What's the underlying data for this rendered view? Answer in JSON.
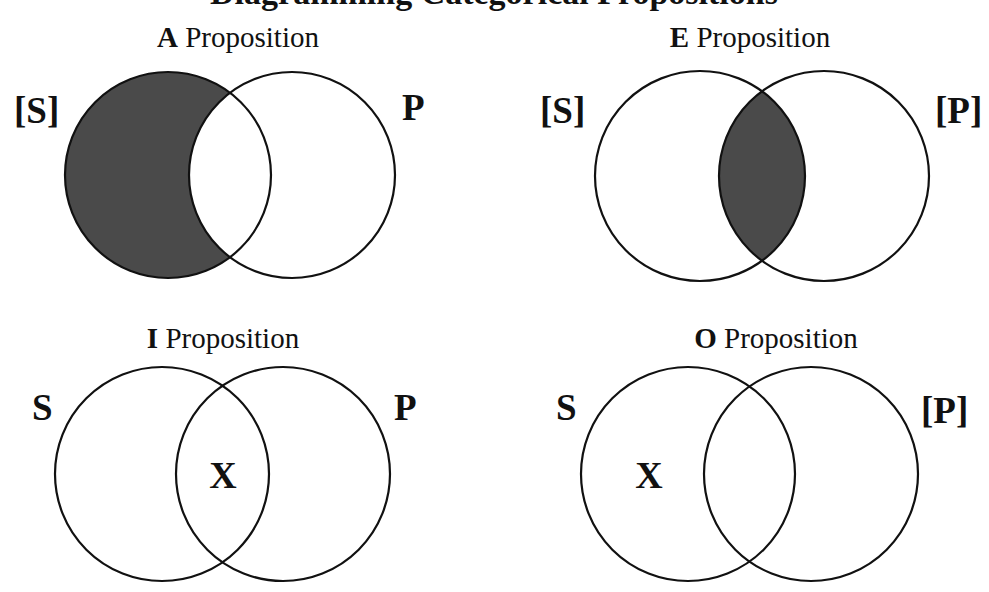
{
  "page": {
    "title_partial": "Diagramming Categorical Propositions",
    "title_visibility": "cut off at top edge; only descenders visible"
  },
  "colors": {
    "background": "#ffffff",
    "stroke": "#111111",
    "shade": "#4a4a4a",
    "text": "#111111"
  },
  "diagrams": [
    {
      "id": "A",
      "letter": "A",
      "word": "Proposition",
      "subject_label": "[S]",
      "predicate_label": "P",
      "shaded_region": "S only (S outside P)",
      "x_mark": "",
      "x_region": "none"
    },
    {
      "id": "E",
      "letter": "E",
      "word": "Proposition",
      "subject_label": "[S]",
      "predicate_label": "[P]",
      "shaded_region": "S and P overlap",
      "x_mark": "",
      "x_region": "none"
    },
    {
      "id": "I",
      "letter": "I",
      "word": "Proposition",
      "subject_label": "S",
      "predicate_label": "P",
      "shaded_region": "none",
      "x_mark": "X",
      "x_region": "S and P overlap"
    },
    {
      "id": "O",
      "letter": "O",
      "word": "Proposition",
      "subject_label": "S",
      "predicate_label": "[P]",
      "shaded_region": "none",
      "x_mark": "X",
      "x_region": "S only (S outside P)"
    }
  ]
}
